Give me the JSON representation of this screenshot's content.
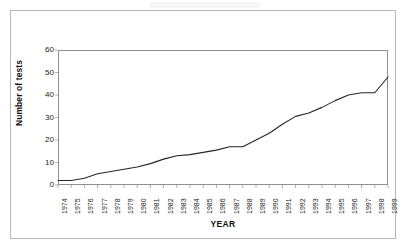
{
  "figure": {
    "background_color": "#ffffff",
    "frame_color": "#b8b8b8",
    "axis_color": "#8f8f8f",
    "line_color": "#262626"
  },
  "chart_data": {
    "type": "line",
    "title": "",
    "xlabel": "YEAR",
    "ylabel": "Number of tests",
    "ylim": [
      0,
      60
    ],
    "yticks": [
      0,
      10,
      20,
      30,
      40,
      50,
      60
    ],
    "grid": false,
    "legend": null,
    "categories": [
      "1974",
      "1975",
      "1976",
      "1977",
      "1978",
      "1979",
      "1980",
      "1981",
      "1982",
      "1983",
      "1984",
      "1985",
      "1986",
      "1987",
      "1988",
      "1989",
      "1990",
      "1991",
      "1992",
      "1993",
      "1994",
      "1995",
      "1996",
      "1997",
      "1998",
      "1999"
    ],
    "values": [
      2,
      2,
      3,
      5,
      6,
      7,
      8,
      9.5,
      11.5,
      13,
      13.5,
      14.5,
      15.5,
      17,
      17,
      20,
      23,
      27,
      30.5,
      32,
      34.5,
      37.5,
      40,
      41,
      41,
      48
    ],
    "series": [
      {
        "name": "Number of tests",
        "values": [
          2,
          2,
          3,
          5,
          6,
          7,
          8,
          9.5,
          11.5,
          13,
          13.5,
          14.5,
          15.5,
          17,
          17,
          20,
          23,
          27,
          30.5,
          32,
          34.5,
          37.5,
          40,
          41,
          41,
          48
        ]
      }
    ]
  }
}
